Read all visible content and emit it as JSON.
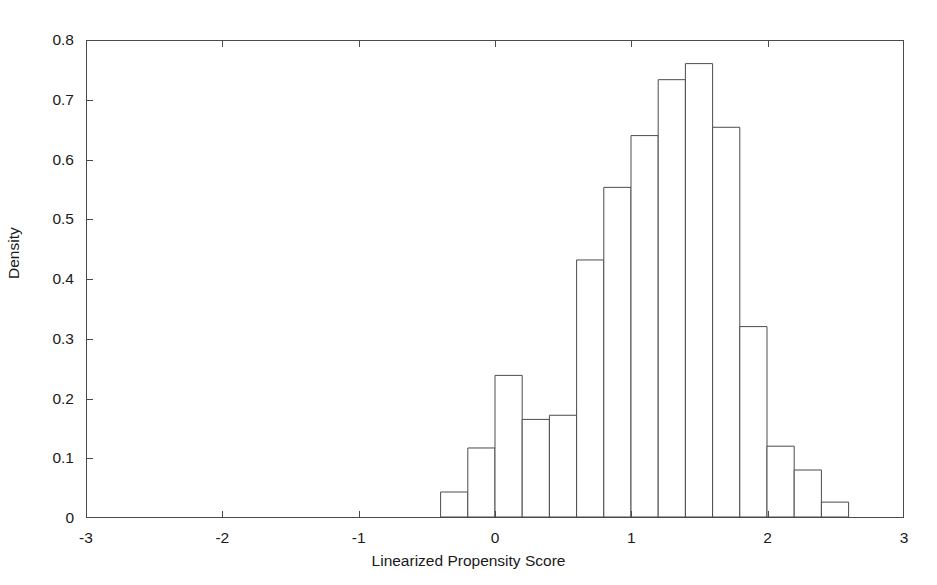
{
  "chart_data": {
    "type": "bar",
    "title": "",
    "subtitle": "",
    "xlabel": "Linearized Propensity Score",
    "ylabel": "Density",
    "xlim": [
      -3,
      3
    ],
    "ylim": [
      0,
      0.8
    ],
    "grid": false,
    "legend": null,
    "bin_width": 0.2,
    "x_tick_labels": [
      "-3",
      "-2",
      "-1",
      "0",
      "1",
      "2",
      "3"
    ],
    "x_tick_values": [
      -3,
      -2,
      -1,
      0,
      1,
      2,
      3
    ],
    "y_tick_labels": [
      "0",
      "0.1",
      "0.2",
      "0.3",
      "0.4",
      "0.5",
      "0.6",
      "0.7",
      "0.8"
    ],
    "y_tick_values": [
      0,
      0.1,
      0.2,
      0.3,
      0.4,
      0.5,
      0.6,
      0.7,
      0.8
    ],
    "bin_edges": [
      -0.4,
      -0.2,
      0.0,
      0.2,
      0.4,
      0.6,
      0.8,
      1.0,
      1.2,
      1.4,
      1.6,
      1.8,
      2.0,
      2.2,
      2.4,
      2.6
    ],
    "bin_centers": [
      -0.3,
      -0.1,
      0.1,
      0.3,
      0.5,
      0.7,
      0.9,
      1.1,
      1.3,
      1.5,
      1.7,
      1.9,
      2.1,
      2.3,
      2.5
    ],
    "values": [
      0.042,
      0.116,
      0.238,
      0.164,
      0.171,
      0.432,
      0.554,
      0.641,
      0.735,
      0.762,
      0.655,
      0.32,
      0.119,
      0.079,
      0.025
    ],
    "bar_fill": "#ffffff",
    "bar_edge_color": "#4a4a4a",
    "axis_color": "#4a4a4a",
    "background": "#ffffff"
  }
}
